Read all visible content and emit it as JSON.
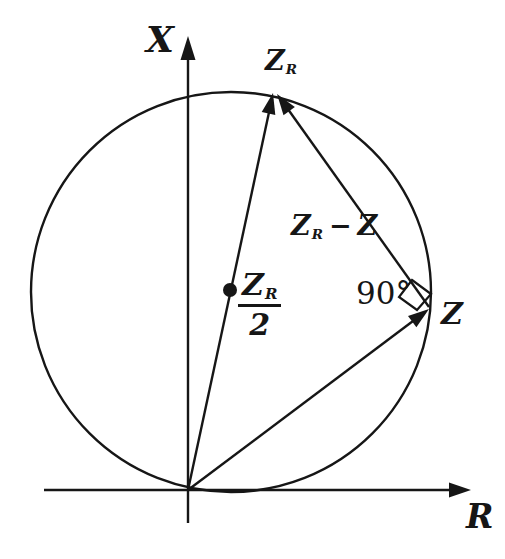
{
  "labels": {
    "x_axis": "X",
    "r_axis": "R",
    "zr": {
      "base": "Z",
      "sub": "R"
    },
    "zr_minus_z": {
      "base": "Z",
      "sub": "R",
      "minus": "−",
      "z": "Z"
    },
    "center_fraction": {
      "num_base": "Z",
      "num_sub": "R",
      "den": "2"
    },
    "right_angle": "90°",
    "z": "Z"
  },
  "colors": {
    "ink": "#161616",
    "background": "#ffffff"
  }
}
